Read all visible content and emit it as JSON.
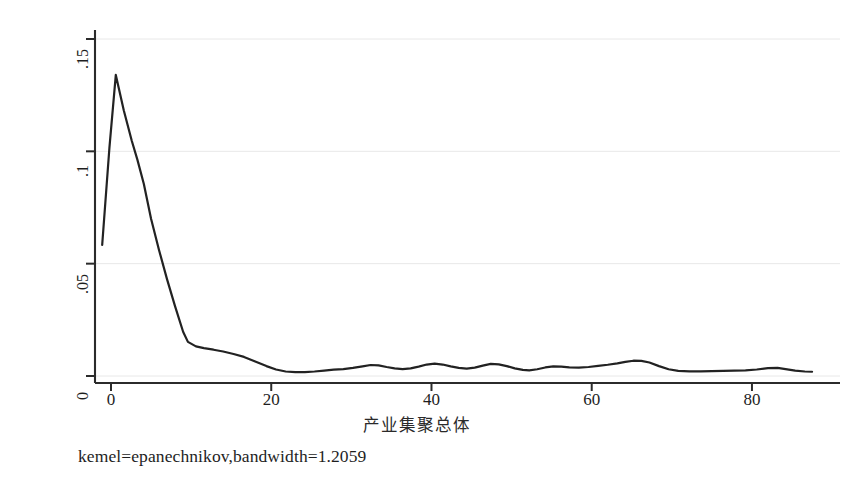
{
  "chart_data": {
    "type": "line",
    "title": "",
    "subtitle": "",
    "xlabel": "产业集聚总体",
    "ylabel": "核密度值",
    "caption": "kemel=epanechnikov,bandwidth=1.2059",
    "grid": true,
    "grid_axis": "y",
    "legend": "none",
    "legend_position": "none",
    "line_color": "#222222",
    "line_width": 2.2,
    "background_color": "#ffffff",
    "gridline_color": "#e8e8e8",
    "axis_color": "#2b2b2b",
    "xlim": [
      -2,
      89
    ],
    "ylim": [
      0,
      0.15
    ],
    "xticks": [
      0,
      20,
      40,
      60,
      80
    ],
    "xtick_labels": [
      "0",
      "20",
      "40",
      "60",
      "80"
    ],
    "yticks": [
      0,
      0.05,
      0.1,
      0.15
    ],
    "ytick_labels": [
      "0",
      ".05",
      ".1",
      ".15"
    ],
    "series": [
      {
        "name": "kdensity",
        "x": [
          -1.1,
          -0.2,
          0.6,
          1.6,
          2.6,
          3.3,
          4.1,
          5.0,
          6.0,
          7.0,
          8.0,
          9.0,
          9.6,
          10.6,
          11.6,
          12.8,
          14.0,
          15.3,
          16.6,
          18.0,
          19.4,
          20.6,
          21.8,
          23.0,
          24.2,
          25.4,
          26.6,
          27.8,
          29.0,
          30.2,
          31.4,
          32.4,
          33.4,
          34.4,
          35.4,
          36.4,
          37.4,
          38.4,
          39.4,
          40.4,
          41.4,
          42.4,
          43.4,
          44.4,
          45.4,
          46.4,
          47.4,
          48.4,
          49.4,
          50.4,
          51.4,
          52.2,
          53.2,
          54.2,
          55.2,
          56.2,
          57.2,
          58.4,
          59.6,
          60.8,
          62.0,
          63.2,
          64.2,
          65.2,
          66.2,
          67.2,
          68.4,
          69.6,
          70.8,
          72.2,
          73.6,
          75.0,
          76.4,
          77.8,
          79.2,
          80.6,
          82.0,
          83.2,
          84.2,
          85.4,
          86.6,
          87.5
        ],
        "y": [
          0.0583,
          0.1015,
          0.134,
          0.1182,
          0.1046,
          0.0962,
          0.0855,
          0.07,
          0.056,
          0.043,
          0.031,
          0.0197,
          0.0152,
          0.0132,
          0.0124,
          0.0117,
          0.0109,
          0.0098,
          0.0085,
          0.0065,
          0.0044,
          0.0029,
          0.002,
          0.0017,
          0.0017,
          0.002,
          0.0024,
          0.0028,
          0.0031,
          0.0036,
          0.0043,
          0.0049,
          0.0047,
          0.004,
          0.0034,
          0.0031,
          0.0034,
          0.0042,
          0.0051,
          0.0055,
          0.0051,
          0.0043,
          0.0036,
          0.0033,
          0.0037,
          0.0046,
          0.0054,
          0.0052,
          0.0044,
          0.0034,
          0.0027,
          0.0025,
          0.003,
          0.0038,
          0.0043,
          0.0042,
          0.0038,
          0.0037,
          0.004,
          0.0045,
          0.005,
          0.0056,
          0.0063,
          0.0068,
          0.0067,
          0.006,
          0.0044,
          0.003,
          0.0023,
          0.0021,
          0.0021,
          0.0022,
          0.0023,
          0.0024,
          0.0025,
          0.0029,
          0.0035,
          0.0036,
          0.0031,
          0.0024,
          0.002,
          0.0019
        ]
      }
    ]
  },
  "axes": {
    "y_title": "核密度值",
    "x_title": "产业集聚总体",
    "y_tick_labels": [
      "0",
      ".05",
      ".1",
      ".15"
    ],
    "x_tick_labels": [
      "0",
      "20",
      "40",
      "60",
      "80"
    ]
  },
  "caption": {
    "text": "kemel=epanechnikov,bandwidth=1.2059"
  }
}
